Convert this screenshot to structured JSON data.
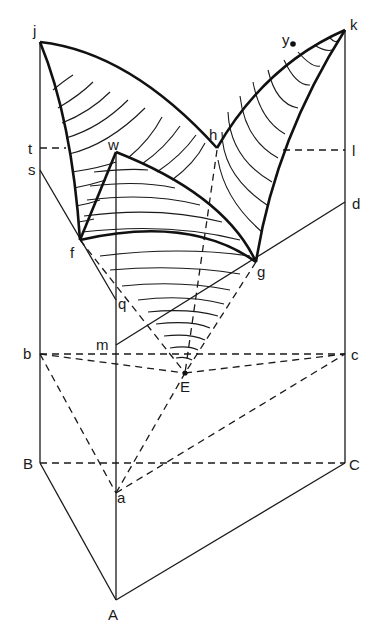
{
  "figure": {
    "type": "ternary-prism phase diagram (liquidus surface with isotherms)",
    "colors": {
      "ink": "#1a1a1a",
      "background": "#ffffff"
    }
  },
  "labels": {
    "j": "j",
    "k": "k",
    "t": "t",
    "s": "s",
    "w": "w",
    "h": "h",
    "l": "l",
    "y": "y",
    "d": "d",
    "f": "f",
    "g": "g",
    "q": "q",
    "m": "m",
    "b": "b",
    "c": "c",
    "E": "E",
    "B": "B",
    "C": "C",
    "a": "a",
    "A": "A"
  },
  "points": {
    "j": [
      40,
      42
    ],
    "k": [
      345,
      30
    ],
    "h": [
      217,
      148
    ],
    "w": [
      116,
      152
    ],
    "f": [
      80,
      240
    ],
    "g": [
      256,
      262
    ],
    "t": [
      40,
      148
    ],
    "s": [
      40,
      170
    ],
    "l": [
      345,
      150
    ],
    "d": [
      345,
      202
    ],
    "q": [
      116,
      300
    ],
    "m": [
      116,
      345
    ],
    "b": [
      40,
      354
    ],
    "c": [
      345,
      354
    ],
    "E": [
      185,
      373
    ],
    "B": [
      40,
      463
    ],
    "C": [
      345,
      463
    ],
    "a": [
      116,
      493
    ],
    "A": [
      116,
      600
    ],
    "y": [
      293,
      44
    ]
  },
  "edges": {
    "solid": [
      "j-B",
      "k-C",
      "w-A",
      "B-A",
      "A-C",
      "s-q",
      "m-d"
    ],
    "dashed": [
      "t-curve(j-f)",
      "l-curve(k-g)",
      "b-c",
      "b-E",
      "E-c",
      "B-C",
      "b-a",
      "a-c",
      "a-E",
      "h-E",
      "f-E",
      "g-E"
    ],
    "thick_boundaries": [
      "j-h",
      "h-k",
      "j-f",
      "k-g",
      "f-w",
      "w-g",
      "f-g",
      "h-g-curve"
    ]
  }
}
